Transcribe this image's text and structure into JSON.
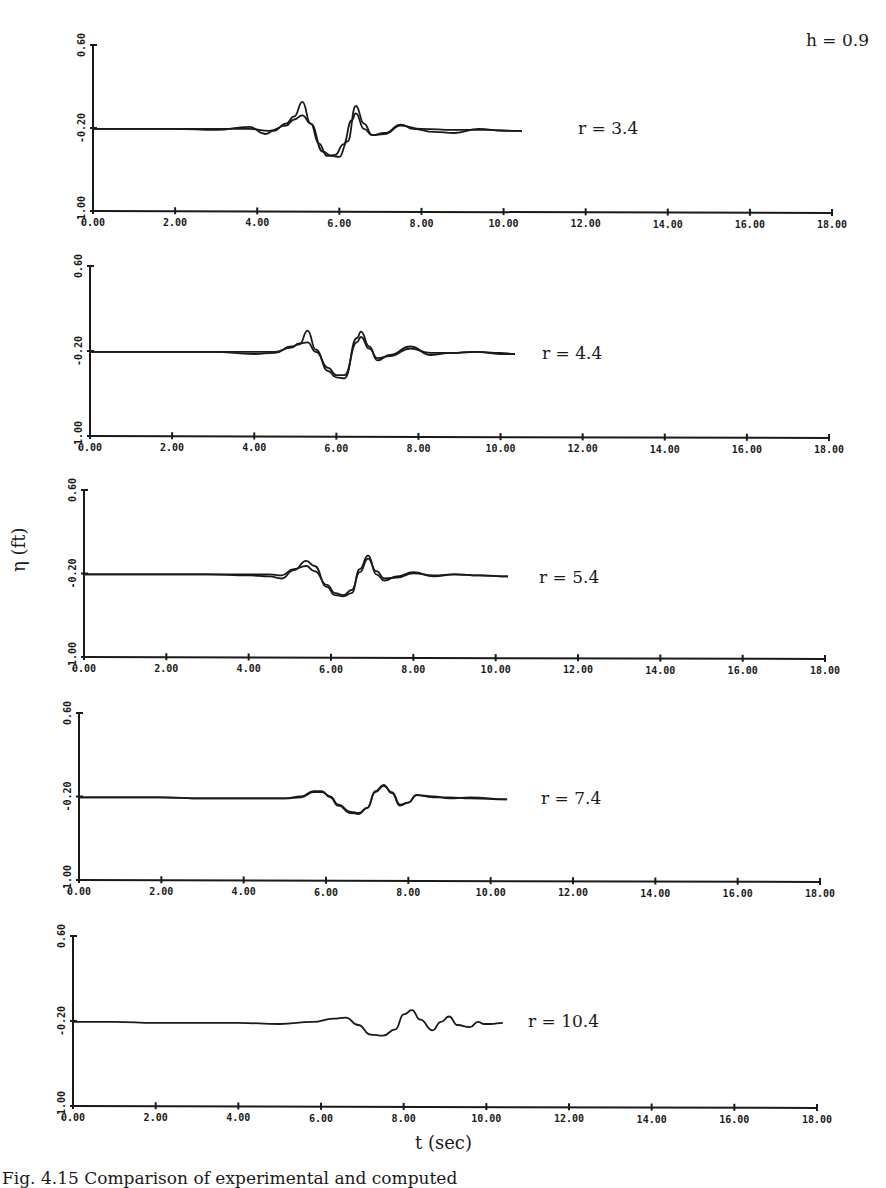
{
  "figure": {
    "header_label": "h = 0.9",
    "y_axis_label": "η (ft)",
    "x_axis_label": "t (sec)",
    "caption": "Fig. 4.15  Comparison of experimental and computed"
  },
  "chart_data": [
    {
      "type": "line",
      "title": "r = 3.4",
      "xlabel": "t (sec)",
      "ylabel": "η (ft)",
      "xlim": [
        0,
        18
      ],
      "ylim": [
        -1.0,
        0.6
      ],
      "x_ticks": [
        "0.00",
        "2.00",
        "4.00",
        "6.00",
        "8.00",
        "10.00",
        "12.00",
        "14.00",
        "16.00",
        "18.00"
      ],
      "y_ticks": [
        "-1.00",
        "-0.20",
        "0.60"
      ],
      "grid": false,
      "legend": null,
      "geom": {
        "x0": 93,
        "x1": 832,
        "ytop": 45,
        "ybot": 211
      },
      "series": [
        {
          "name": "measured",
          "t": [
            0,
            1,
            2,
            3,
            3.8,
            4.2,
            4.4,
            4.7,
            4.9,
            5.1,
            5.3,
            5.6,
            5.8,
            6.0,
            6.2,
            6.4,
            6.6,
            6.8,
            7.1,
            7.5,
            7.8,
            8.3,
            8.8,
            9.4,
            10.0,
            10.45
          ],
          "eta": [
            0,
            0,
            0,
            -0.01,
            0.02,
            -0.05,
            -0.02,
            0.05,
            0.12,
            0.26,
            0.05,
            -0.22,
            -0.26,
            -0.27,
            -0.12,
            0.22,
            0.05,
            -0.06,
            -0.04,
            0.04,
            0.0,
            -0.03,
            -0.04,
            0.0,
            -0.02,
            -0.02
          ]
        },
        {
          "name": "computed",
          "t": [
            0,
            1,
            2,
            3,
            3.8,
            4.3,
            4.7,
            4.9,
            5.1,
            5.3,
            5.5,
            5.7,
            5.9,
            6.1,
            6.3,
            6.4,
            6.6,
            6.8,
            7.1,
            7.5,
            8.0,
            8.8,
            9.6,
            10.45
          ],
          "eta": [
            0,
            0,
            0,
            0,
            0,
            -0.02,
            0.03,
            0.09,
            0.13,
            0.05,
            -0.14,
            -0.26,
            -0.25,
            -0.15,
            0.08,
            0.15,
            0.0,
            -0.06,
            -0.05,
            0.03,
            0.0,
            -0.01,
            -0.01,
            -0.02
          ]
        }
      ]
    },
    {
      "type": "line",
      "title": "r = 4.4",
      "xlabel": "t (sec)",
      "ylabel": "η (ft)",
      "xlim": [
        0,
        18
      ],
      "ylim": [
        -1.0,
        0.6
      ],
      "x_ticks": [
        "0.00",
        "2.00",
        "4.00",
        "6.00",
        "8.00",
        "10.00",
        "12.00",
        "14.00",
        "16.00",
        "18.00"
      ],
      "y_ticks": [
        "-1.00",
        "-0.20",
        "0.60"
      ],
      "grid": false,
      "legend": null,
      "geom": {
        "x0": 90,
        "x1": 829,
        "ytop": 266,
        "ybot": 436
      },
      "series": [
        {
          "name": "measured",
          "t": [
            0,
            1,
            2,
            3,
            4.0,
            4.5,
            4.9,
            5.1,
            5.3,
            5.5,
            5.8,
            6.0,
            6.2,
            6.5,
            6.6,
            6.8,
            7.0,
            7.3,
            7.8,
            8.3,
            8.8,
            9.4,
            10.0,
            10.35
          ],
          "eta": [
            0,
            0,
            0,
            0,
            -0.02,
            -0.01,
            0.05,
            0.07,
            0.2,
            0.02,
            -0.18,
            -0.24,
            -0.25,
            0.13,
            0.19,
            0.05,
            -0.08,
            -0.03,
            0.05,
            -0.03,
            -0.01,
            0.0,
            -0.02,
            -0.02
          ]
        },
        {
          "name": "computed",
          "t": [
            0,
            1,
            2,
            3,
            4.0,
            4.5,
            4.9,
            5.1,
            5.3,
            5.5,
            5.8,
            6.0,
            6.2,
            6.5,
            6.6,
            6.8,
            7.0,
            7.3,
            7.8,
            8.3,
            8.8,
            9.4,
            10.0,
            10.35
          ],
          "eta": [
            0,
            0,
            0,
            0,
            0,
            0,
            0.04,
            0.08,
            0.09,
            0.0,
            -0.15,
            -0.22,
            -0.22,
            0.09,
            0.14,
            0.03,
            -0.06,
            -0.04,
            0.03,
            -0.01,
            -0.01,
            0.0,
            -0.01,
            -0.02
          ]
        }
      ]
    },
    {
      "type": "line",
      "title": "r = 5.4",
      "xlabel": "t (sec)",
      "ylabel": "η (ft)",
      "xlim": [
        0,
        18
      ],
      "ylim": [
        -1.0,
        0.6
      ],
      "x_ticks": [
        "0.00",
        "2.00",
        "4.00",
        "6.00",
        "8.00",
        "10.00",
        "12.00",
        "14.00",
        "16.00",
        "18.00"
      ],
      "y_ticks": [
        "-1.00",
        "-0.20",
        "0.60"
      ],
      "grid": false,
      "legend": null,
      "geom": {
        "x0": 84,
        "x1": 825,
        "ytop": 490,
        "ybot": 657
      },
      "series": [
        {
          "name": "measured",
          "t": [
            0,
            1,
            2,
            3,
            4.0,
            4.5,
            4.8,
            5.1,
            5.4,
            5.6,
            5.9,
            6.1,
            6.3,
            6.5,
            6.7,
            6.9,
            7.1,
            7.3,
            7.6,
            8.0,
            8.5,
            9.0,
            9.6,
            10.3
          ],
          "eta": [
            0,
            0,
            0,
            0,
            -0.01,
            -0.02,
            -0.04,
            0.04,
            0.13,
            0.08,
            -0.12,
            -0.2,
            -0.21,
            -0.18,
            0.05,
            0.18,
            0.0,
            -0.06,
            -0.02,
            0.02,
            -0.02,
            0.0,
            -0.01,
            -0.02
          ]
        },
        {
          "name": "computed",
          "t": [
            0,
            1,
            2,
            3,
            4.0,
            4.5,
            4.8,
            5.1,
            5.4,
            5.6,
            5.9,
            6.1,
            6.3,
            6.5,
            6.7,
            6.9,
            7.1,
            7.3,
            7.6,
            8.0,
            8.5,
            9.0,
            9.6,
            10.3
          ],
          "eta": [
            0,
            0,
            0,
            0,
            0,
            0,
            -0.01,
            0.05,
            0.08,
            0.03,
            -0.1,
            -0.18,
            -0.2,
            -0.15,
            0.02,
            0.15,
            0.03,
            -0.04,
            -0.03,
            0.01,
            -0.01,
            0.0,
            -0.01,
            -0.02
          ]
        }
      ]
    },
    {
      "type": "line",
      "title": "r = 7.4",
      "xlabel": "t (sec)",
      "ylabel": "η (ft)",
      "xlim": [
        0,
        18
      ],
      "ylim": [
        -1.0,
        0.6
      ],
      "x_ticks": [
        "0.00",
        "2.00",
        "4.00",
        "6.00",
        "8.00",
        "10.00",
        "12.00",
        "14.00",
        "16.00",
        "18.00"
      ],
      "y_ticks": [
        "-1.00",
        "-0.20",
        "0.60"
      ],
      "grid": false,
      "legend": null,
      "geom": {
        "x0": 79,
        "x1": 820,
        "ytop": 713,
        "ybot": 880
      },
      "series": [
        {
          "name": "measured",
          "t": [
            0,
            1,
            2,
            3,
            4.0,
            5.0,
            5.4,
            5.7,
            5.9,
            6.1,
            6.3,
            6.6,
            6.8,
            7.0,
            7.2,
            7.4,
            7.6,
            7.8,
            8.0,
            8.2,
            8.6,
            9.0,
            9.5,
            10.4
          ],
          "eta": [
            0,
            0,
            0,
            -0.01,
            -0.01,
            -0.01,
            0.01,
            0.06,
            0.06,
            0.0,
            -0.08,
            -0.15,
            -0.16,
            -0.1,
            0.06,
            0.12,
            0.04,
            -0.08,
            -0.05,
            0.02,
            0.01,
            -0.01,
            0.0,
            -0.02
          ]
        },
        {
          "name": "computed",
          "t": [
            0,
            1,
            2,
            3,
            4.0,
            5.0,
            5.4,
            5.7,
            5.9,
            6.1,
            6.3,
            6.6,
            6.8,
            7.0,
            7.2,
            7.4,
            7.6,
            7.8,
            8.0,
            8.2,
            8.6,
            9.0,
            9.5,
            10.4
          ],
          "eta": [
            0,
            0,
            0,
            -0.01,
            -0.01,
            -0.01,
            0.0,
            0.05,
            0.05,
            0.01,
            -0.07,
            -0.14,
            -0.15,
            -0.1,
            0.05,
            0.11,
            0.05,
            -0.07,
            -0.05,
            0.02,
            0.0,
            0.0,
            -0.01,
            -0.02
          ]
        }
      ]
    },
    {
      "type": "line",
      "title": "r = 10.4",
      "xlabel": "t (sec)",
      "ylabel": "η (ft)",
      "xlim": [
        0,
        18
      ],
      "ylim": [
        -1.0,
        0.6
      ],
      "x_ticks": [
        "0.00",
        "2.00",
        "4.00",
        "6.00",
        "8.00",
        "10.00",
        "12.00",
        "14.00",
        "16.00",
        "18.00"
      ],
      "y_ticks": [
        "-1.00",
        "-0.20",
        "0.60"
      ],
      "grid": false,
      "legend": null,
      "geom": {
        "x0": 73,
        "x1": 817,
        "ytop": 936,
        "ybot": 1106
      },
      "series": [
        {
          "name": "computed",
          "t": [
            0,
            1,
            2,
            3,
            4,
            5,
            5.8,
            6.3,
            6.6,
            6.9,
            7.2,
            7.5,
            7.8,
            8.0,
            8.2,
            8.4,
            8.7,
            8.9,
            9.1,
            9.3,
            9.6,
            9.8,
            9.95,
            10.1,
            10.4
          ],
          "eta": [
            0,
            0,
            -0.01,
            -0.01,
            -0.01,
            -0.02,
            0.0,
            0.03,
            0.04,
            -0.03,
            -0.12,
            -0.13,
            -0.07,
            0.07,
            0.11,
            0.02,
            -0.08,
            0.0,
            0.05,
            -0.03,
            -0.05,
            0.0,
            -0.02,
            -0.02,
            -0.01
          ]
        }
      ]
    }
  ]
}
